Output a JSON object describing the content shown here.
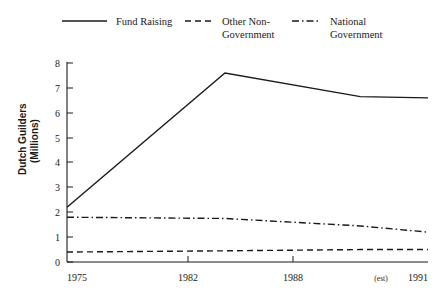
{
  "chart_data": {
    "type": "line",
    "title": "",
    "xlabel": "",
    "ylabel": "Dutch Guilders (Millions)",
    "ylabel_line1": "Dutch Guilders",
    "ylabel_line2": "(Millions)",
    "x": [
      1975,
      1982,
      1988,
      1991
    ],
    "xtick_labels": [
      "1975",
      "1982",
      "1988",
      "1991"
    ],
    "xlim": [
      1975,
      1991
    ],
    "ylim": [
      0,
      8
    ],
    "yticks": [
      0,
      1,
      2,
      3,
      4,
      5,
      6,
      7,
      8
    ],
    "ytick_labels": [
      "0",
      "1",
      "2",
      "3",
      "4",
      "5",
      "6",
      "7",
      "8"
    ],
    "grid": false,
    "legend_position": "top",
    "annotations": [
      {
        "text": "(est)",
        "near": "1991",
        "meaning": "estimated value"
      }
    ],
    "series": [
      {
        "name": "Fund Raising",
        "style": "solid",
        "color": "#1a1a1a",
        "values": [
          2.2,
          7.6,
          6.65,
          6.6
        ]
      },
      {
        "name": "Other Non-Government",
        "name_line1": "Other Non-",
        "name_line2": "Government",
        "style": "dashed",
        "color": "#1a1a1a",
        "values": [
          0.4,
          0.45,
          0.5,
          0.5
        ]
      },
      {
        "name": "National Government",
        "name_line1": "National",
        "name_line2": "Government",
        "style": "dash-dot",
        "color": "#1a1a1a",
        "values": [
          1.8,
          1.75,
          1.45,
          1.2
        ]
      }
    ]
  },
  "legend": {
    "items": [
      {
        "label_line1": "Fund Raising",
        "label_line2": ""
      },
      {
        "label_line1": "Other Non-",
        "label_line2": "Government"
      },
      {
        "label_line1": "National",
        "label_line2": "Government"
      }
    ]
  },
  "axis": {
    "y_title_line1": "Dutch Guilders",
    "y_title_line2": "(Millions)",
    "y_ticks": [
      "8",
      "7",
      "6",
      "5",
      "4",
      "3",
      "2",
      "1",
      "0"
    ],
    "x_ticks": [
      "1975",
      "1982",
      "1988",
      "1991"
    ],
    "est_note": "(est)"
  },
  "colors": {
    "ink": "#1a1a1a",
    "background": "#ffffff"
  }
}
